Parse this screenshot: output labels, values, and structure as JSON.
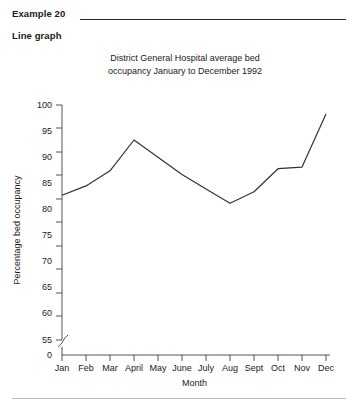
{
  "header": {
    "example_label": "Example 20",
    "kind_label": "Line graph"
  },
  "chart_data": {
    "type": "line",
    "title": "District General Hospital average bed occupancy January to December 1992",
    "title_line1": "District General Hospital average bed",
    "title_line2": "occupancy January to December 1992",
    "xlabel": "Month",
    "ylabel": "Percentage bed occupancy",
    "categories": [
      "Jan",
      "Feb",
      "Mar",
      "April",
      "May",
      "June",
      "July",
      "Aug",
      "Sept",
      "Oct",
      "Nov",
      "Dec"
    ],
    "values": [
      82.7,
      84.5,
      87.4,
      93.3,
      90.0,
      86.7,
      83.9,
      81.2,
      83.4,
      87.8,
      88.1,
      98.3
    ],
    "series": [
      {
        "name": "Percentage bed occupancy",
        "values": [
          82.7,
          84.5,
          87.4,
          93.3,
          90.0,
          86.7,
          83.9,
          81.2,
          83.4,
          87.8,
          88.1,
          98.3
        ]
      }
    ],
    "ylim": [
      55,
      100
    ],
    "y_ticks": [
      "0",
      "55",
      "60",
      "65",
      "70",
      "75",
      "80",
      "85",
      "90",
      "95",
      "100"
    ],
    "y_tick_values": [
      0,
      55,
      60,
      65,
      70,
      75,
      80,
      85,
      90,
      95,
      100
    ],
    "axis_break": true,
    "axis_break_note": "y-axis broken between 0 and 55",
    "grid": false,
    "legend": "none",
    "line_color": "#333333",
    "axis_color": "#555555"
  }
}
